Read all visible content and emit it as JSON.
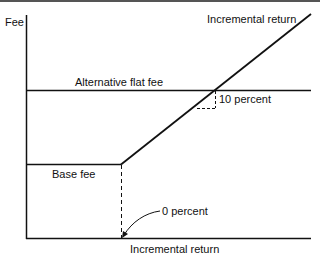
{
  "diagram": {
    "y_axis_label": "Fee",
    "x_axis_label": "Incremental return",
    "line_label": "Incremental return",
    "flat_fee_label": "Alternative flat fee",
    "base_fee_label": "Base fee",
    "slope_label": "10 percent",
    "origin_label": "0 percent",
    "colors": {
      "line": "#111111",
      "background": "#ffffff",
      "border": "#555555"
    }
  }
}
